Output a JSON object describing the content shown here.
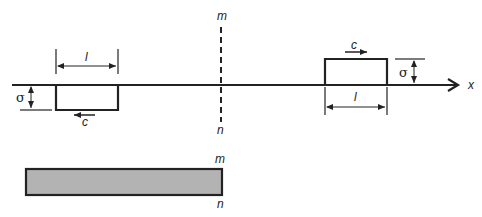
{
  "diagram": {
    "labels": {
      "section_top": "m",
      "section_bottom": "n",
      "bar_section_top": "m",
      "bar_section_bottom": "n",
      "axis": "x",
      "left_pulse_length": "l",
      "left_pulse_amplitude": "σ",
      "left_pulse_velocity": "c",
      "right_pulse_length": "l",
      "right_pulse_amplitude": "σ",
      "right_pulse_velocity": "c"
    },
    "colors": {
      "line": "#222222",
      "bar_fill": "#b3b3b3"
    },
    "description": {
      "left_pulse": "compressive pulse below axis moving left",
      "right_pulse": "tensile pulse above axis moving right",
      "bar": "elastic bar with free end at section m-n"
    }
  }
}
